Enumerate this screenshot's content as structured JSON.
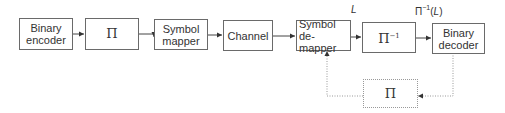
{
  "blocks": {
    "binary_encoder": {
      "line1": "Binary",
      "line2": "encoder"
    },
    "interleaver": {
      "symbol": "Π"
    },
    "symbol_mapper": {
      "line1": "Symbol",
      "line2": "mapper"
    },
    "channel": {
      "label": "Channel"
    },
    "symbol_demapper": {
      "line1": "Symbol",
      "line2": "de-mapper"
    },
    "deinterleaver": {
      "symbol": "Π",
      "sup": "−1"
    },
    "binary_decoder": {
      "line1": "Binary",
      "line2": "decoder"
    },
    "feedback_interleaver": {
      "symbol": "Π"
    }
  },
  "labels": {
    "demapper_output": "L",
    "deinterleaver_output_prefix": "Π",
    "deinterleaver_output_sup": "−1",
    "deinterleaver_output_open": "(",
    "deinterleaver_output_var": "L",
    "deinterleaver_output_close": ")"
  },
  "colors": {
    "line": "#444444",
    "box_border": "#6a6a6a",
    "dotted": "#999999"
  }
}
